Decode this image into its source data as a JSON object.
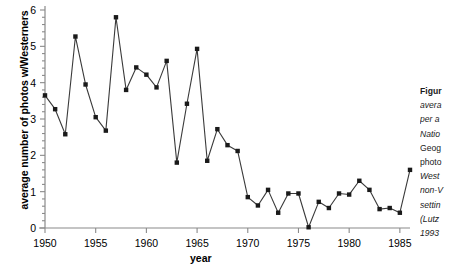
{
  "chart_data": {
    "type": "line",
    "title": "",
    "xlabel": "year",
    "ylabel": "average number of photos w/Westerners",
    "xlim": [
      1950,
      1986
    ],
    "ylim": [
      0,
      6
    ],
    "grid": false,
    "legend": "none",
    "marker": "filled-square",
    "line_color": "#3a3a3a",
    "marker_color": "#1a1a1a",
    "xticks": [
      1950,
      1955,
      1960,
      1965,
      1970,
      1975,
      1980,
      1985
    ],
    "xticklabels": [
      "1950",
      "1955",
      "1960",
      "1965",
      "1970",
      "1975",
      "1980",
      "1985"
    ],
    "yticks": [
      0,
      1,
      2,
      3,
      4,
      5,
      6
    ],
    "yticklabels": [
      "0",
      "1",
      "2",
      "3",
      "4",
      "5",
      "6"
    ],
    "x": [
      1950,
      1951,
      1952,
      1953,
      1954,
      1955,
      1956,
      1957,
      1958,
      1959,
      1960,
      1961,
      1962,
      1963,
      1964,
      1965,
      1966,
      1967,
      1968,
      1969,
      1970,
      1971,
      1972,
      1973,
      1974,
      1975,
      1976,
      1977,
      1978,
      1979,
      1980,
      1981,
      1982,
      1983,
      1984,
      1985,
      1986
    ],
    "values": [
      3.65,
      3.27,
      2.58,
      5.27,
      3.95,
      3.05,
      2.68,
      5.8,
      3.8,
      4.42,
      4.22,
      3.87,
      4.6,
      1.8,
      3.42,
      4.93,
      1.85,
      2.72,
      2.28,
      2.12,
      0.85,
      0.62,
      1.05,
      0.42,
      0.95,
      0.95,
      0.02,
      0.72,
      0.55,
      0.95,
      0.92,
      1.3,
      1.05,
      0.52,
      0.55,
      0.42,
      1.6
    ]
  },
  "caption": {
    "lines": [
      {
        "text": "Figur",
        "bold": true,
        "italic": false
      },
      {
        "text": "avera",
        "bold": false,
        "italic": true
      },
      {
        "text": "per a",
        "bold": false,
        "italic": true
      },
      {
        "text": "Natio",
        "bold": false,
        "italic": true
      },
      {
        "text": "Geog",
        "bold": false,
        "italic": false
      },
      {
        "text": "photo",
        "bold": false,
        "italic": false
      },
      {
        "text": "West",
        "bold": false,
        "italic": true
      },
      {
        "text": "non-V",
        "bold": false,
        "italic": true
      },
      {
        "text": "settin",
        "bold": false,
        "italic": true
      },
      {
        "text": "(Lutz",
        "bold": false,
        "italic": true
      },
      {
        "text": "1993",
        "bold": false,
        "italic": true
      }
    ]
  }
}
